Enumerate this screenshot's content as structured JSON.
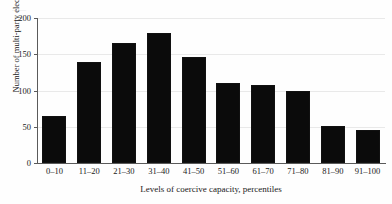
{
  "chart_data": {
    "type": "bar",
    "title": "",
    "subtitle": "",
    "xlabel": "Levels of coercive capacity, percentiles",
    "ylabel": "Number of multi-party elections",
    "categories": [
      "0–10",
      "11–20",
      "21–30",
      "31–40",
      "41–50",
      "51–60",
      "61–70",
      "71–80",
      "81–90",
      "91–100"
    ],
    "values": [
      65,
      140,
      165,
      179,
      146,
      110,
      108,
      100,
      51,
      45
    ],
    "ylim": [
      0,
      200
    ],
    "yticks": [
      0,
      50,
      100,
      150,
      200
    ],
    "ytick_labels": [
      "0",
      "50",
      "100",
      "150",
      "200"
    ],
    "grid": true,
    "grid_axis": "y",
    "legend": "none",
    "bar_color": "#0b0b0b",
    "background_color": "#ffffff",
    "axis_color": "#5a5a5a",
    "gridline_color": "#e9e9e9",
    "annotations": []
  },
  "artifacts": {
    "top_edge_sliver_left": "· ·",
    "top_edge_sliver_right": "——"
  }
}
